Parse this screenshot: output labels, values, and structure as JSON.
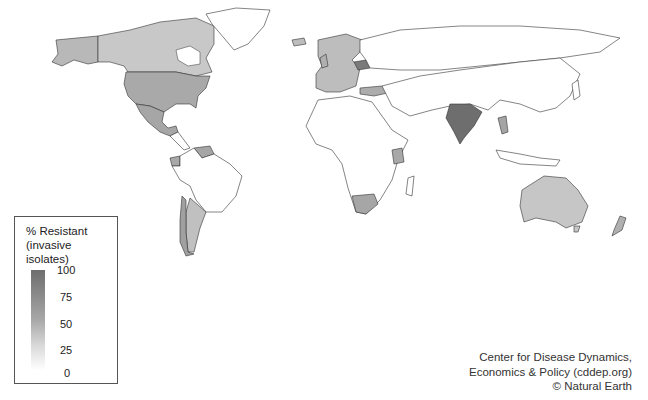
{
  "map": {
    "type": "choropleth",
    "title": "% Resistant (invasive isolates)",
    "projection": "world",
    "colors": {
      "no_data": "#ffffff",
      "stroke": "#333333",
      "scale_low": "#ffffff",
      "scale_high": "#6e6e6e"
    },
    "regions": [
      {
        "name": "Canada",
        "level": "low-mid",
        "fill": "#c8c8c8"
      },
      {
        "name": "Alaska",
        "level": "mid",
        "fill": "#b8b8b8"
      },
      {
        "name": "United States",
        "level": "mid",
        "fill": "#a9a9a9"
      },
      {
        "name": "Mexico",
        "level": "mid",
        "fill": "#a6a6a6"
      },
      {
        "name": "Greenland",
        "level": "no-data",
        "fill": "#ffffff"
      },
      {
        "name": "Argentina",
        "level": "low-mid",
        "fill": "#c0c0c0"
      },
      {
        "name": "Chile",
        "level": "mid",
        "fill": "#a0a0a0"
      },
      {
        "name": "Ecuador",
        "level": "mid",
        "fill": "#a8a8a8"
      },
      {
        "name": "Venezuela",
        "level": "mid",
        "fill": "#a5a5a5"
      },
      {
        "name": "Europe (various)",
        "level": "low-mid",
        "fill": "#bdbdbd"
      },
      {
        "name": "Belarus",
        "level": "high",
        "fill": "#7a7a7a"
      },
      {
        "name": "Turkey",
        "level": "mid",
        "fill": "#acacac"
      },
      {
        "name": "India",
        "level": "high",
        "fill": "#6e6e6e"
      },
      {
        "name": "Thailand",
        "level": "mid",
        "fill": "#a4a4a4"
      },
      {
        "name": "Kenya",
        "level": "mid",
        "fill": "#a8a8a8"
      },
      {
        "name": "South Africa",
        "level": "mid",
        "fill": "#a6a6a6"
      },
      {
        "name": "Australia",
        "level": "low-mid",
        "fill": "#c6c6c6"
      },
      {
        "name": "New Zealand",
        "level": "mid",
        "fill": "#b0b0b0"
      }
    ]
  },
  "legend": {
    "title_line1": "% Resistant",
    "title_line2": "(invasive isolates)",
    "ticks": [
      "100",
      "75",
      "50",
      "25",
      "0"
    ]
  },
  "credit": {
    "line1": "Center for Disease Dynamics,",
    "line2": "Economics & Policy (cddep.org)",
    "line3": "© Natural Earth"
  }
}
